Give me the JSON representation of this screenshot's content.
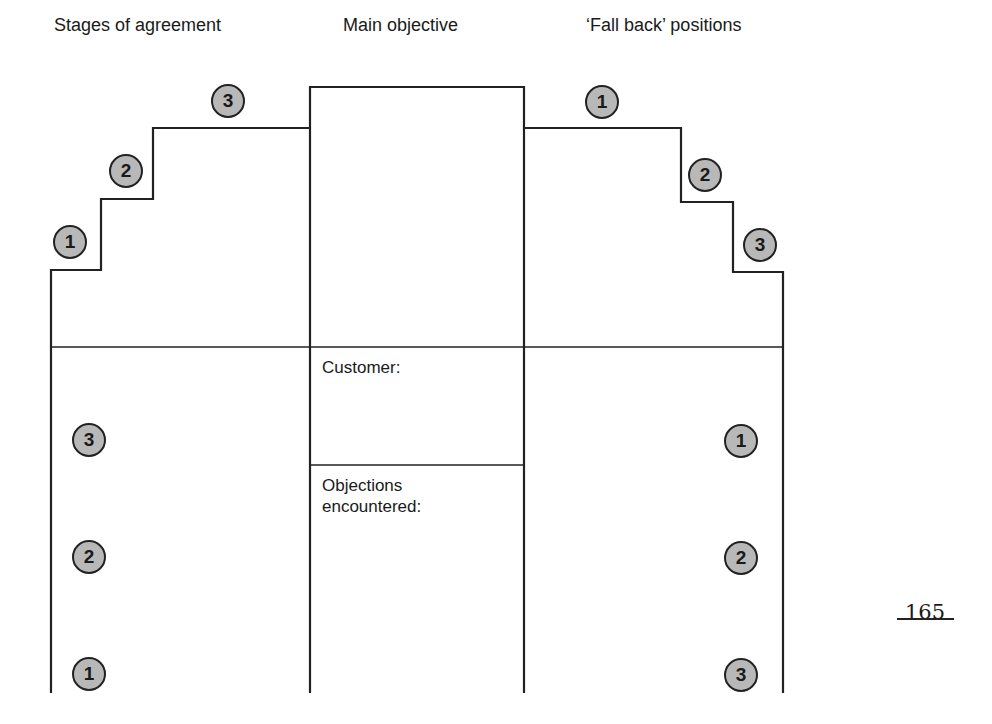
{
  "headings": {
    "left": "Stages of agreement",
    "center": "Main objective",
    "right": "‘Fall back’ positions"
  },
  "center_box": {
    "customer_label": "Customer:",
    "objections_label": "Objections encountered:"
  },
  "stages_of_agreement": {
    "steps": [
      "1",
      "2",
      "3"
    ],
    "lower_markers": [
      "3",
      "2",
      "1"
    ]
  },
  "fall_back_positions": {
    "steps": [
      "1",
      "2",
      "3"
    ],
    "lower_markers": [
      "1",
      "2",
      "3"
    ]
  },
  "page_number": "165"
}
